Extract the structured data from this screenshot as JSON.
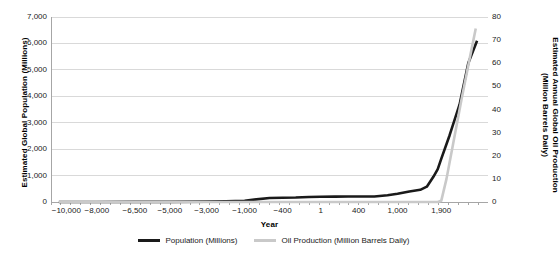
{
  "chart_data": {
    "type": "line",
    "title": "",
    "xlabel": "Year",
    "y_left_label": "Estimated Global Population (Millions)",
    "y_right_label_line1": "Estimated Annual Global Oil Production",
    "y_right_label_line2": "(Million Barrels Daily)",
    "grid": true,
    "legend_position": "bottom",
    "y_left": {
      "min": 0,
      "max": 7000,
      "step": 1000,
      "ticks": [
        "0",
        "1,000",
        "2,000",
        "3,000",
        "4,000",
        "5,000",
        "6,000",
        "7,000"
      ],
      "tick_values": [
        0,
        1000,
        2000,
        3000,
        4000,
        5000,
        6000,
        7000
      ]
    },
    "y_right": {
      "min": 0,
      "max": 80,
      "step": 10,
      "ticks": [
        "0",
        "10",
        "20",
        "30",
        "40",
        "50",
        "60",
        "70",
        "80"
      ],
      "tick_values": [
        0,
        10,
        20,
        30,
        40,
        50,
        60,
        70,
        80
      ]
    },
    "x_axis": {
      "type": "category",
      "tick_labels": [
        "−10,000",
        "−8,000",
        "−6,500",
        "−5,000",
        "−3,000",
        "−1,000",
        "−400",
        "1",
        "400",
        "1,000",
        "1,900"
      ],
      "tick_positions_frac": [
        0.035,
        0.105,
        0.192,
        0.272,
        0.356,
        0.443,
        0.53,
        0.617,
        0.704,
        0.793,
        0.893
      ]
    },
    "series": [
      {
        "name": "Population (Millions)",
        "axis": "left",
        "color": "#1a1a1a",
        "width": 2.6,
        "points_frac": [
          [
            0.018,
            1
          ],
          [
            0.105,
            2
          ],
          [
            0.192,
            5
          ],
          [
            0.272,
            5
          ],
          [
            0.356,
            14
          ],
          [
            0.4,
            27
          ],
          [
            0.443,
            50
          ],
          [
            0.47,
            100
          ],
          [
            0.5,
            150
          ],
          [
            0.53,
            162
          ],
          [
            0.56,
            170
          ],
          [
            0.59,
            190
          ],
          [
            0.617,
            200
          ],
          [
            0.65,
            202
          ],
          [
            0.68,
            206
          ],
          [
            0.704,
            206
          ],
          [
            0.74,
            210
          ],
          [
            0.77,
            254
          ],
          [
            0.793,
            310
          ],
          [
            0.82,
            400
          ],
          [
            0.845,
            461
          ],
          [
            0.86,
            579
          ],
          [
            0.875,
            954
          ],
          [
            0.885,
            1241
          ],
          [
            0.893,
            1634
          ],
          [
            0.912,
            2518
          ],
          [
            0.935,
            3692
          ],
          [
            0.955,
            5263
          ],
          [
            0.975,
            6100
          ]
        ]
      },
      {
        "name": "Oil Production (Million Barrels Daily)",
        "axis": "right",
        "color": "#c9c9c9",
        "width": 2.6,
        "points_frac": [
          [
            0.018,
            0
          ],
          [
            0.443,
            0
          ],
          [
            0.704,
            0
          ],
          [
            0.86,
            0
          ],
          [
            0.885,
            0
          ],
          [
            0.893,
            0.5
          ],
          [
            0.905,
            10
          ],
          [
            0.92,
            25
          ],
          [
            0.94,
            45
          ],
          [
            0.958,
            62
          ],
          [
            0.972,
            75
          ]
        ]
      }
    ]
  },
  "legend": {
    "items": [
      {
        "label": "Population (Millions)",
        "swatch": "pop"
      },
      {
        "label": "Oil Production (Million Barrels Daily)",
        "swatch": "oil"
      }
    ]
  }
}
